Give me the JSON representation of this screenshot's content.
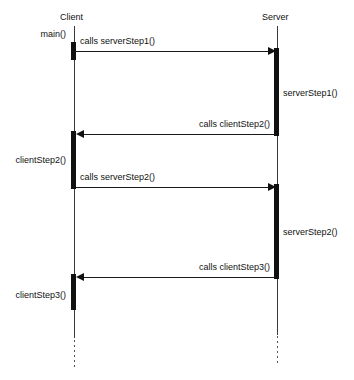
{
  "diagram": {
    "participants": [
      {
        "id": "client",
        "label": "Client",
        "x": 73
      },
      {
        "id": "server",
        "label": "Server",
        "x": 276
      }
    ],
    "activation_labels": [
      {
        "id": "main",
        "label": "main()",
        "side": "left"
      },
      {
        "id": "server-step-1",
        "label": "serverStep1()",
        "side": "right"
      },
      {
        "id": "client-step-2",
        "label": "clientStep2()",
        "side": "left"
      },
      {
        "id": "server-step-2",
        "label": "serverStep2()",
        "side": "right"
      },
      {
        "id": "client-step-3",
        "label": "clientStep3()",
        "side": "left"
      }
    ],
    "messages": [
      {
        "id": "m1",
        "label": "calls serverStep1()",
        "direction": "right",
        "y": 51
      },
      {
        "id": "m2",
        "label": "calls clientStep2()",
        "direction": "left",
        "y": 134
      },
      {
        "id": "m3",
        "label": "calls serverStep2()",
        "direction": "right",
        "y": 187
      },
      {
        "id": "m4",
        "label": "calls clientStep3()",
        "direction": "left",
        "y": 277
      }
    ],
    "colors": {
      "line": "#1a1a1a",
      "activation": "#111111",
      "background": "#ffffff",
      "text": "#111111"
    }
  }
}
